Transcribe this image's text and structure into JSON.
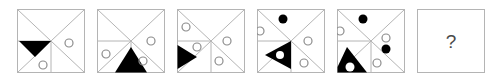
{
  "puzzle": {
    "type": "visual-analogy-matrix",
    "panel_count": 6,
    "frame_color": "#b4b4b4",
    "line_color": "#b4b4b4",
    "fill_color": "#000000",
    "circle_stroke": "#8c8c8c",
    "background": "#ffffff",
    "answer_marker": "?",
    "panels": [
      {
        "index": 1,
        "name": "panel-1",
        "triangle": {
          "shape": "black-triangle",
          "direction": "down",
          "position": "left-middle",
          "has_inner_circle": false
        },
        "circles": [
          {
            "style": "open",
            "position": "right-middle"
          },
          {
            "style": "open",
            "position": "bottom-center-left"
          }
        ],
        "dots": [],
        "circle_count": 2
      },
      {
        "index": 2,
        "name": "panel-2",
        "triangle": {
          "shape": "black-triangle",
          "direction": "up",
          "position": "bottom-center",
          "has_inner_circle": false
        },
        "circles": [
          {
            "style": "open",
            "position": "right-middle"
          },
          {
            "style": "open",
            "position": "left-lower"
          },
          {
            "style": "open",
            "position": "bottom-center-right"
          }
        ],
        "dots": [],
        "circle_count": 3
      },
      {
        "index": 3,
        "name": "panel-3",
        "triangle": {
          "shape": "black-triangle",
          "direction": "right",
          "position": "left-middle",
          "has_inner_circle": false
        },
        "circles": [
          {
            "style": "open",
            "position": "top-left"
          },
          {
            "style": "open",
            "position": "left-lower"
          },
          {
            "style": "open",
            "position": "right-middle"
          },
          {
            "style": "open",
            "position": "bottom-center-right"
          }
        ],
        "dots": [],
        "circle_count": 4
      },
      {
        "index": 4,
        "name": "panel-4",
        "triangle": {
          "shape": "black-triangle",
          "direction": "left",
          "position": "left-lower",
          "has_inner_circle": true
        },
        "circles": [
          {
            "style": "open",
            "position": "top-left"
          },
          {
            "style": "open",
            "position": "right-middle"
          },
          {
            "style": "open",
            "position": "bottom-center-right"
          }
        ],
        "dots": [
          {
            "style": "filled",
            "position": "top-center"
          }
        ],
        "circle_count": 4
      },
      {
        "index": 5,
        "name": "panel-5",
        "triangle": {
          "shape": "black-triangle",
          "direction": "up",
          "position": "bottom-left",
          "has_inner_circle": true
        },
        "circles": [
          {
            "style": "open",
            "position": "top-left"
          },
          {
            "style": "open",
            "position": "right-upper"
          },
          {
            "style": "open",
            "position": "bottom-center-right"
          }
        ],
        "dots": [
          {
            "style": "filled",
            "position": "top-center"
          },
          {
            "style": "filled",
            "position": "right-middle"
          }
        ],
        "circle_count": 5
      },
      {
        "index": 6,
        "name": "answer-panel",
        "is_answer": true,
        "label": "?"
      }
    ]
  }
}
